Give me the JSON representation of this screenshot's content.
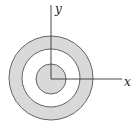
{
  "diagram": {
    "axes": {
      "x_label": "x",
      "y_label": "y"
    },
    "shapes": [
      {
        "type": "annulus",
        "description": "shaded outer ring",
        "fill": "#d9d9d9",
        "outer_radius": 42,
        "inner_radius": 29
      },
      {
        "type": "disk",
        "description": "shaded inner disk centered at origin",
        "fill": "#d9d9d9",
        "radius": 15
      }
    ],
    "colors": {
      "shade": "#d9d9d9",
      "stroke": "#555555"
    }
  }
}
